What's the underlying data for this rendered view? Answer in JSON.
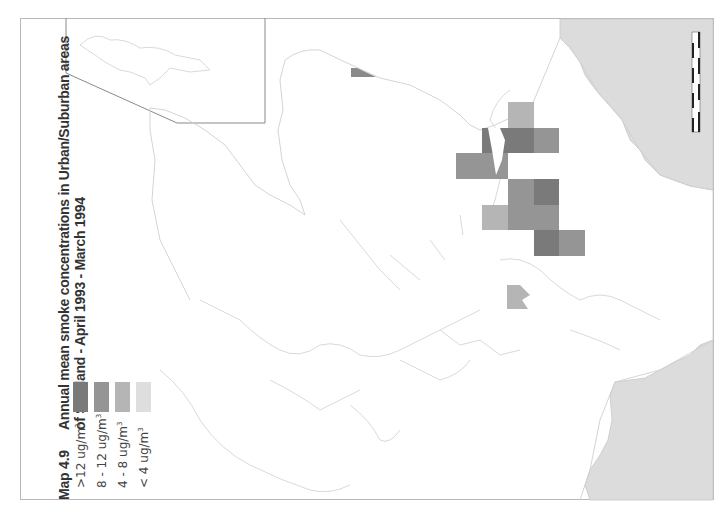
{
  "map": {
    "number": "Map 4.9",
    "title_line1": "Annual mean smoke concentrations in Urban/Suburban areas",
    "title_line2": "of Scotland - April 1993 - March 1994"
  },
  "legend": {
    "items": [
      {
        "label": ">12 ug/m",
        "sup": "3",
        "color": "#7a7a7a"
      },
      {
        "label": "8 - 12 ug/m",
        "sup": "3",
        "color": "#959595"
      },
      {
        "label": "4 - 8 ug/m",
        "sup": "3",
        "color": "#b5b5b5"
      },
      {
        "label": "< 4 ug/m",
        "sup": "3",
        "color": "#dedede"
      }
    ]
  },
  "colors": {
    "land_outline": "#c8c8c8",
    "neighbour_land": "#dcdcdc",
    "frame": "#b8b8b8"
  },
  "data_cells": [
    {
      "x": 508,
      "y": 102,
      "w": 26,
      "h": 26,
      "class": "4-8"
    },
    {
      "x": 482,
      "y": 128,
      "w": 26,
      "h": 25,
      "class": ">12"
    },
    {
      "x": 508,
      "y": 128,
      "w": 26,
      "h": 25,
      "class": ">12"
    },
    {
      "x": 534,
      "y": 128,
      "w": 25,
      "h": 25,
      "class": "8-12"
    },
    {
      "x": 456,
      "y": 153,
      "w": 52,
      "h": 26,
      "class": "8-12"
    },
    {
      "x": 508,
      "y": 179,
      "w": 26,
      "h": 26,
      "class": "8-12"
    },
    {
      "x": 534,
      "y": 179,
      "w": 25,
      "h": 26,
      "class": ">12"
    },
    {
      "x": 482,
      "y": 205,
      "w": 26,
      "h": 25,
      "class": "4-8"
    },
    {
      "x": 508,
      "y": 205,
      "w": 51,
      "h": 25,
      "class": "8-12"
    },
    {
      "x": 534,
      "y": 230,
      "w": 25,
      "h": 26,
      "class": ">12"
    },
    {
      "x": 559,
      "y": 230,
      "w": 26,
      "h": 26,
      "class": "8-12"
    },
    {
      "x": 351,
      "y": 68,
      "w": 25,
      "h": 9,
      "class": "8-12"
    },
    {
      "x": 507,
      "y": 285,
      "w": 24,
      "h": 24,
      "class": "4-8"
    }
  ],
  "scale_bar": {
    "orientation": "vertical"
  }
}
